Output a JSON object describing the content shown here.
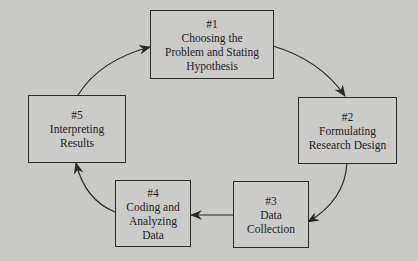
{
  "diagram": {
    "type": "cycle",
    "background": "#c9c9c7",
    "steps": [
      {
        "num": "#1",
        "lines": [
          "Choosing the",
          "Problem and Stating",
          "Hypothesis"
        ]
      },
      {
        "num": "#2",
        "lines": [
          "Formulating",
          "Research Design"
        ]
      },
      {
        "num": "#3",
        "lines": [
          "Data",
          "Collection"
        ]
      },
      {
        "num": "#4",
        "lines": [
          "Coding and",
          "Analyzing",
          "Data"
        ]
      },
      {
        "num": "#5",
        "lines": [
          "Interpreting",
          "Results"
        ]
      }
    ],
    "flow": [
      "#1 -> #2",
      "#2 -> #3",
      "#3 -> #4",
      "#4 -> #5",
      "#5 -> #1"
    ]
  }
}
